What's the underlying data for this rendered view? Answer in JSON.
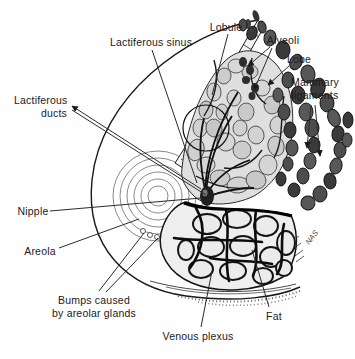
{
  "figure": {
    "signature": "NAS",
    "ink_color": "#1a1a1a",
    "background_color": "#ffffff"
  },
  "labels": {
    "lobule": "Lobule",
    "lactiferous_sinus": "Lactiferous sinus",
    "alveoli": "Alveoli",
    "lobe": "Lobe",
    "mammary_ligaments_line1": "Mammary",
    "mammary_ligaments_line2": "ligaments",
    "lactiferous_ducts_line1": "Lactiferous",
    "lactiferous_ducts_line2": "ducts",
    "nipple": "Nipple",
    "areola": "Areola",
    "bumps_line1": "Bumps caused",
    "bumps_line2": "by areolar glands",
    "venous_plexus": "Venous plexus",
    "fat": "Fat"
  }
}
